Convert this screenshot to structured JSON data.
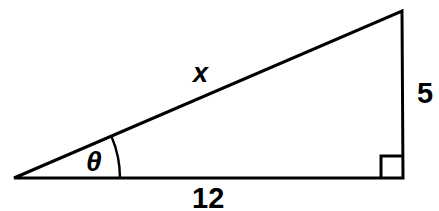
{
  "figure": {
    "type": "right-triangle-trigonometry-diagram",
    "background_color": "#ffffff",
    "stroke_color": "#000000",
    "stroke_width": 3,
    "labels": {
      "hypotenuse": "x",
      "angle": "θ",
      "opposite_side": "5",
      "adjacent_side": "12"
    },
    "geometry": {
      "left_vertex": [
        14,
        178
      ],
      "right_vertex": [
        403,
        178
      ],
      "apex_vertex": [
        402,
        11
      ],
      "right_angle_marker_size": 22,
      "angle_arc_radius": 106
    }
  }
}
